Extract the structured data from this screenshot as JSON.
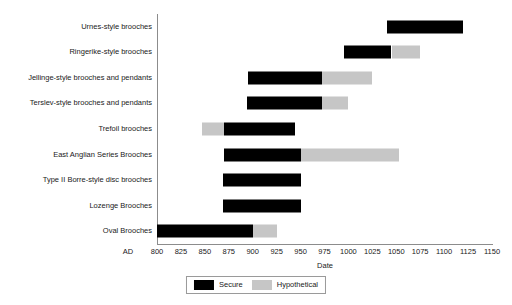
{
  "chart_data": {
    "type": "bar",
    "chart_subtype": "horizontal-range-gantt",
    "title": "",
    "xlabel": "Date",
    "ylabel": "",
    "xlim": [
      800,
      1150
    ],
    "xticks": [
      800,
      825,
      850,
      875,
      900,
      925,
      950,
      975,
      1000,
      1025,
      1050,
      1075,
      1100,
      1125,
      1150
    ],
    "xtick_labels": [
      "800",
      "825",
      "850",
      "875",
      "900",
      "925",
      "950",
      "975",
      "1000",
      "1025",
      "1050",
      "1075",
      "1100",
      "1125",
      "1150"
    ],
    "x_axis_prefix": "AD",
    "grid": false,
    "legend_position": "bottom-center",
    "legend": [
      {
        "name": "Secure",
        "color": "#000000"
      },
      {
        "name": "Hypothetical",
        "color": "#c6c6c6"
      }
    ],
    "categories": [
      "Urnes-style brooches",
      "Ringerike-style brooches",
      "Jellinge-style brooches and pendants",
      "Terslev-style brooches and pendants",
      "Trefoil brooches",
      "East Anglian Series Brooches",
      "Type II Borre-style disc brooches",
      "Lozenge Brooches",
      "Oval Brooches"
    ],
    "bars": [
      {
        "category": "Urnes-style brooches",
        "segments": [
          {
            "series": "Secure",
            "start": 1040,
            "end": 1120
          }
        ]
      },
      {
        "category": "Ringerike-style brooches",
        "segments": [
          {
            "series": "Secure",
            "start": 995,
            "end": 1045
          },
          {
            "series": "Hypothetical",
            "start": 1045,
            "end": 1075
          }
        ]
      },
      {
        "category": "Jellinge-style brooches and pendants",
        "segments": [
          {
            "series": "Secure",
            "start": 895,
            "end": 972
          },
          {
            "series": "Hypothetical",
            "start": 972,
            "end": 1025
          }
        ]
      },
      {
        "category": "Terslev-style brooches and pendants",
        "segments": [
          {
            "series": "Secure",
            "start": 894,
            "end": 972
          },
          {
            "series": "Hypothetical",
            "start": 972,
            "end": 1000
          }
        ]
      },
      {
        "category": "Trefoil brooches",
        "segments": [
          {
            "series": "Hypothetical",
            "start": 847,
            "end": 870
          },
          {
            "series": "Secure",
            "start": 870,
            "end": 944
          }
        ]
      },
      {
        "category": "East Anglian Series Brooches",
        "segments": [
          {
            "series": "Secure",
            "start": 870,
            "end": 950
          },
          {
            "series": "Hypothetical",
            "start": 950,
            "end": 1053
          }
        ]
      },
      {
        "category": "Type II Borre-style disc brooches",
        "segments": [
          {
            "series": "Secure",
            "start": 869,
            "end": 950
          }
        ]
      },
      {
        "category": "Lozenge Brooches",
        "segments": [
          {
            "series": "Secure",
            "start": 869,
            "end": 950
          }
        ]
      },
      {
        "category": "Oval Brooches",
        "segments": [
          {
            "series": "Secure",
            "start": 800,
            "end": 900
          },
          {
            "series": "Hypothetical",
            "start": 900,
            "end": 925
          }
        ]
      }
    ]
  },
  "colors": {
    "secure": "#000000",
    "hypothetical": "#c6c6c6",
    "axis": "#8c8c8c",
    "text": "#1a1a1a",
    "background": "#ffffff"
  }
}
